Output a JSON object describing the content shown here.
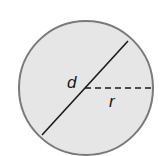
{
  "diagram": {
    "type": "circle",
    "fill_color": "#e6e6e6",
    "stroke_color": "#7a7a7a",
    "line_color": "#1a1a1a",
    "labels": {
      "diameter": "d",
      "radius": "r"
    }
  }
}
